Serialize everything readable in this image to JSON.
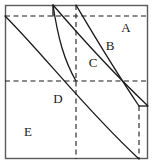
{
  "figure": {
    "type": "geometry-diagram",
    "title": "",
    "canvas": {
      "width": 153,
      "height": 164
    },
    "stroke_color": "#1a1a1a",
    "frame_color": "#5a5a5a",
    "background_color": "#ffffff",
    "frame": {
      "x": 5,
      "y": 5,
      "width": 143,
      "height": 154
    },
    "labels": [
      {
        "id": "A",
        "text": "A",
        "x": 126,
        "y": 29
      },
      {
        "id": "B",
        "text": "B",
        "x": 110,
        "y": 47
      },
      {
        "id": "C",
        "text": "C",
        "x": 93,
        "y": 64
      },
      {
        "id": "D",
        "text": "D",
        "x": 58,
        "y": 100
      },
      {
        "id": "E",
        "text": "E",
        "x": 28,
        "y": 133
      }
    ],
    "dashed_lines": [
      {
        "id": "top-horizontal",
        "x1": 5,
        "y1": 16,
        "x2": 148,
        "y2": 16
      },
      {
        "id": "mid-horizontal",
        "x1": 5,
        "y1": 81,
        "x2": 148,
        "y2": 81
      },
      {
        "id": "center-vertical",
        "x1": 76,
        "y1": 5,
        "x2": 76,
        "y2": 159
      },
      {
        "id": "right-vertical",
        "x1": 139,
        "y1": 106,
        "x2": 139,
        "y2": 159
      }
    ],
    "solid_segments": [
      {
        "id": "upper-vertical-tick",
        "x1": 53,
        "y1": 5,
        "x2": 53,
        "y2": 16
      },
      {
        "id": "right-horizontal-tick",
        "x1": 139,
        "y1": 106,
        "x2": 148,
        "y2": 106
      }
    ],
    "arcs": [
      {
        "id": "arc-outer-upper",
        "from": [
          53,
          5
        ],
        "to": [
          148,
          106
        ],
        "rx": 143,
        "ry": 154,
        "sweep": 1
      },
      {
        "id": "arc-inner-upper",
        "from": [
          76,
          5
        ],
        "to": [
          139,
          106
        ],
        "rx": 110,
        "ry": 118,
        "sweep": 1
      },
      {
        "id": "arc-outer-lower",
        "from": [
          5,
          16
        ],
        "to": [
          139,
          159
        ],
        "rx": 143,
        "ry": 154,
        "sweep": 1
      },
      {
        "id": "arc-inner-lower",
        "from": [
          5,
          16
        ],
        "to": [
          76,
          81
        ],
        "rx": 100,
        "ry": 100,
        "sweep": 1
      }
    ]
  }
}
